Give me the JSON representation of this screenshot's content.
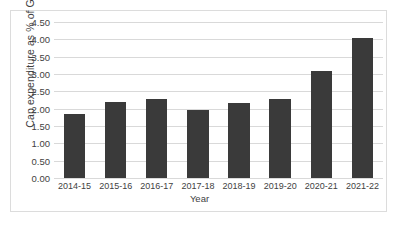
{
  "chart_data": {
    "type": "bar",
    "title": "",
    "xlabel": "Year",
    "ylabel": "Cap expenditure as % of GDP",
    "categories": [
      "2014-15",
      "2015-16",
      "2016-17",
      "2017-18",
      "2018-19",
      "2019-20",
      "2020-21",
      "2021-22"
    ],
    "values": [
      1.85,
      2.2,
      2.28,
      1.97,
      2.16,
      2.27,
      3.1,
      4.05
    ],
    "ylim": [
      0.0,
      4.5
    ],
    "ytick_labels": [
      "0.00",
      "0.50",
      "1.00",
      "1.50",
      "2.00",
      "2.50",
      "3.00",
      "3.50",
      "4.00",
      "4.50"
    ],
    "ytick_values": [
      0.0,
      0.5,
      1.0,
      1.5,
      2.0,
      2.5,
      3.0,
      3.5,
      4.0,
      4.5
    ],
    "grid": true,
    "legend": false,
    "legend_position": "none",
    "bar_color": "#3a3a3a",
    "gridline_color": "#d9d9d9",
    "background_color": "#ffffff",
    "border_color": "#dcdcdc",
    "text_color": "#3f3f3f"
  }
}
